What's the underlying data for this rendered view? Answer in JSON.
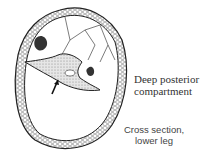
{
  "diagram": {
    "title_line1": "Deep posterior",
    "title_line2": "compartment",
    "caption_line1": "Cross section,",
    "caption_line2": "lower leg",
    "colors": {
      "outline": "#222222",
      "stipple_fill": "#cfcfcf",
      "bone_dark": "#333333",
      "background": "#ffffff"
    }
  }
}
